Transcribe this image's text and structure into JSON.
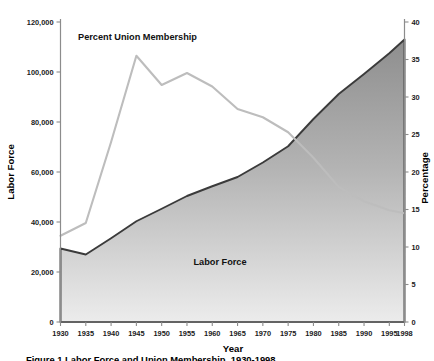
{
  "figure": {
    "caption": "Figure 1  Labor Force and Union Membership, 1930-1998"
  },
  "chart_data": {
    "type": "area",
    "title": "",
    "xlabel": "Year",
    "ylabel": "Labor Force",
    "y2label": "Percentage",
    "grid": false,
    "legend_position": "inline-annotations",
    "x": [
      1930,
      1935,
      1940,
      1945,
      1950,
      1955,
      1960,
      1965,
      1970,
      1975,
      1980,
      1985,
      1990,
      1995,
      1998
    ],
    "xlim": [
      1930,
      1998
    ],
    "xticks": [
      "1930",
      "1935",
      "1940",
      "1945",
      "1950",
      "1955",
      "1960",
      "1965",
      "1970",
      "1975",
      "1980",
      "1985",
      "1990",
      "1995",
      "1998"
    ],
    "ylim": [
      0,
      120000
    ],
    "yticks": [
      "0",
      "20,000",
      "40,000",
      "60,000",
      "80,000",
      "100,000",
      "120,000"
    ],
    "ytickvalues": [
      0,
      20000,
      40000,
      60000,
      80000,
      100000,
      120000
    ],
    "y2lim": [
      0,
      40
    ],
    "y2ticks": [
      "0",
      "5",
      "10",
      "15",
      "20",
      "25",
      "30",
      "35",
      "40"
    ],
    "y2tickvalues": [
      0,
      5,
      10,
      15,
      20,
      25,
      30,
      35,
      40
    ],
    "series": [
      {
        "name": "Labor Force",
        "label": "Labor Force",
        "axis": "left",
        "render": "area",
        "fill_top_color": "#8e8e8e",
        "fill_bottom_color": "#e8e8e8",
        "stroke_color": "#3b3b3b",
        "values": [
          29400,
          27000,
          33500,
          40300,
          45300,
          50400,
          54300,
          58000,
          63800,
          70300,
          81200,
          91200,
          99200,
          107500,
          113000
        ]
      },
      {
        "name": "Percent Union Membership",
        "label": "Percent Union Membership",
        "axis": "right",
        "render": "line",
        "stroke_color": "#bdbdbd",
        "values": [
          11.5,
          13.2,
          24.0,
          35.5,
          31.6,
          33.2,
          31.4,
          28.4,
          27.3,
          25.3,
          21.9,
          18.0,
          16.1,
          14.9,
          14.5
        ]
      }
    ],
    "annotations": [
      {
        "name": "union-series-label",
        "text": "Percent Union Membership",
        "x": 1945,
        "y": 121000
      },
      {
        "name": "labor-force-series-label",
        "text": "Labor Force",
        "x": 1963,
        "y": 23500
      }
    ]
  }
}
